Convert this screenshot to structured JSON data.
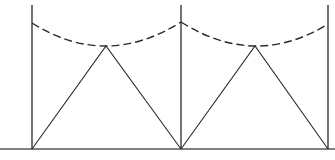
{
  "diagram": {
    "width": 335,
    "height": 160,
    "background": "#ffffff",
    "stroke_color": "#2a2a2a",
    "ground": {
      "y": 149,
      "x1": 0,
      "x2": 335,
      "color": "#555555",
      "width": 1.6
    },
    "poles": [
      {
        "id": "left",
        "x": 32,
        "top": 5,
        "bottom": 149,
        "attach_y": 23
      },
      {
        "id": "middle",
        "x": 181,
        "top": 5,
        "bottom": 149,
        "attach_y": 22
      },
      {
        "id": "right",
        "x": 328,
        "top": 5,
        "bottom": 149,
        "attach_y": 24
      }
    ],
    "triangles": [
      {
        "id": "left-span",
        "base_left": [
          32,
          149
        ],
        "apex": [
          106,
          46
        ],
        "base_right": [
          181,
          149
        ]
      },
      {
        "id": "right-span",
        "base_left": [
          181,
          149
        ],
        "apex": [
          255,
          46
        ],
        "base_right": [
          328,
          149
        ]
      }
    ],
    "dashed_curves": [
      {
        "id": "left-sag",
        "from": [
          32,
          23
        ],
        "via": [
          106,
          46
        ],
        "to": [
          181,
          22
        ]
      },
      {
        "id": "right-sag",
        "from": [
          181,
          22
        ],
        "via": [
          255,
          46
        ],
        "to": [
          328,
          24
        ]
      }
    ],
    "dash_pattern": "8,4"
  }
}
